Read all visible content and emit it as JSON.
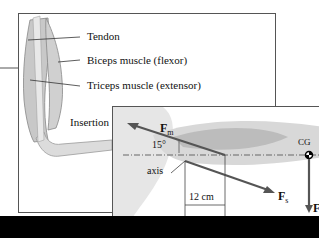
{
  "diagram": {
    "panel_top": {
      "labels": {
        "tendon": "Tendon",
        "biceps": "Biceps muscle (flexor)",
        "triceps": "Triceps muscle (extensor)",
        "insertion": "Insertion"
      }
    },
    "panel_bottom": {
      "labels": {
        "force_muscle": "F",
        "force_muscle_sub": "m",
        "angle": "15°",
        "axis": "axis",
        "distance": "12 cm",
        "force_s": "F",
        "force_s_sub": "s",
        "cg": "CG",
        "force_g": "F",
        "force_g_sub": "g"
      }
    },
    "colors": {
      "arrow": "#555555",
      "arm_fill": "#d6d6d6",
      "muscle_fill": "#bdbdbd",
      "border": "#555555",
      "bar": "#000000"
    }
  }
}
